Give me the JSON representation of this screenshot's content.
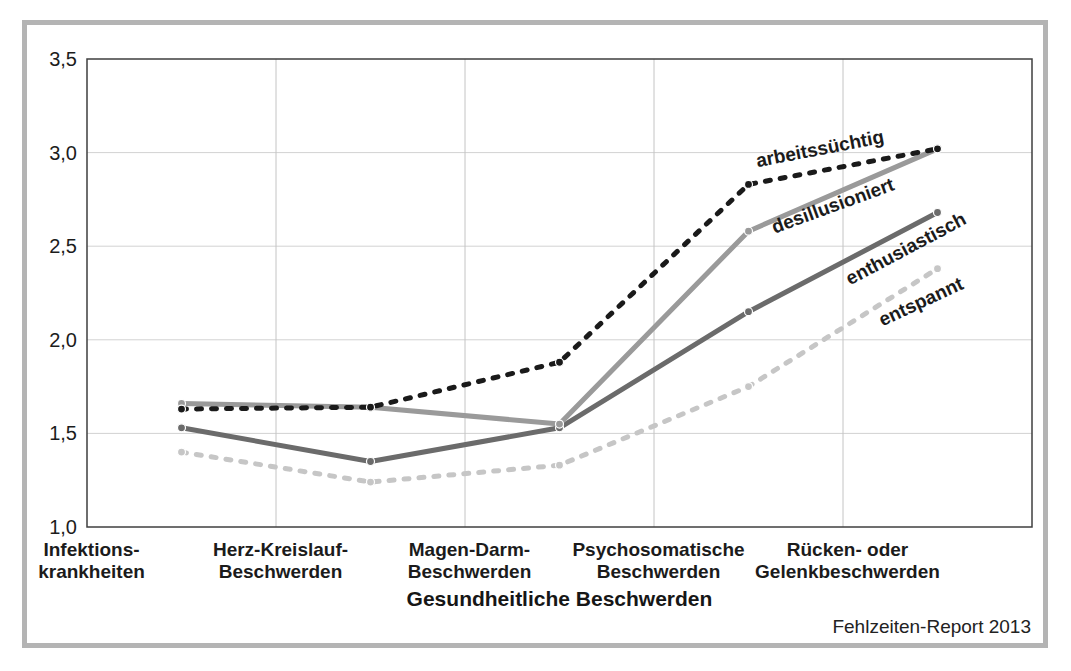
{
  "chart_data": {
    "type": "line",
    "title": "",
    "xlabel": "Gesundheitliche Beschwerden",
    "ylabel": "",
    "source": "Fehlzeiten-Report 2013",
    "ylim": [
      1.0,
      3.5
    ],
    "ytick_step": 0.5,
    "grid": true,
    "legend_position": "inline-labels-on-lines",
    "yticks": [
      "3,5",
      "3,0",
      "2,5",
      "2,0",
      "1,5",
      "1,0"
    ],
    "categories": [
      "Infektionskrankheiten",
      "Herz-Kreislauf-Beschwerden",
      "Magen-Darm-Beschwerden",
      "Psychosomatische Beschwerden",
      "Rücken- oder Gelenkbeschwerden"
    ],
    "categories_lines": [
      [
        "Infektions-",
        "krankheiten"
      ],
      [
        "Herz-Kreislauf-",
        "Beschwerden"
      ],
      [
        "Magen-Darm-",
        "Beschwerden"
      ],
      [
        "Psychosomatische",
        "Beschwerden"
      ],
      [
        "Rücken- oder",
        "Gelenkbeschwerden"
      ]
    ],
    "series": [
      {
        "name": "arbeitssüchtig",
        "values": [
          1.63,
          1.64,
          1.88,
          2.83,
          3.02
        ],
        "color": "#1a1a1a",
        "style": "dashed",
        "label_pos": {
          "x": 793,
          "y": 124,
          "angle": -11
        }
      },
      {
        "name": "desillusioniert",
        "values": [
          1.66,
          1.64,
          1.55,
          2.58,
          3.02
        ],
        "color": "#9a9a9a",
        "style": "solid",
        "label_pos": {
          "x": 806,
          "y": 181,
          "angle": -20
        }
      },
      {
        "name": "enthusiastisch",
        "values": [
          1.53,
          1.35,
          1.53,
          2.15,
          2.68
        ],
        "color": "#6b6b6b",
        "style": "solid",
        "label_pos": {
          "x": 879,
          "y": 224,
          "angle": -28
        }
      },
      {
        "name": "entspannt",
        "values": [
          1.4,
          1.24,
          1.33,
          1.75,
          2.38
        ],
        "color": "#c6c6c6",
        "style": "dashed",
        "label_pos": {
          "x": 894,
          "y": 277,
          "angle": -25
        }
      }
    ],
    "colors": {
      "plot_border": "#3f3f3f",
      "h_gridline": "#d2d2d2",
      "v_gridline": "#c4c4c4",
      "frame_border": "#b4b4b4"
    }
  }
}
